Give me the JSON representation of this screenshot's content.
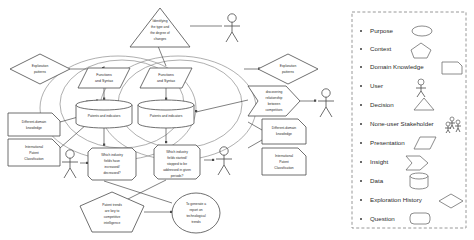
{
  "diagram": {
    "nodes": {
      "decision_top": "Identifying the type and the degree of changes",
      "exploration_left": "Exploration patterns",
      "exploration_right": "Exploration patterns",
      "domain_knowledge_left": "Different-domain knowledge",
      "ipc_left": "International Patent Classification",
      "domain_knowledge_right": "Different-domain knowledge",
      "ipc_right": "International Patent Classification",
      "presentation_left": "Functions and Syntax",
      "presentation_right": "Functions and Syntax",
      "data_left": "Patents and indicators",
      "data_right": "Patents and indicators",
      "question_left": "Which industry fields have increased/ decreased?",
      "question_right": "Which industry fields started/ stopped to be addressed in given periods?",
      "insight_right": "discovering relationship between competitors",
      "context_bottom": "Patent trends are key to competitive intelligence",
      "purpose_bottom": "To generate a report on technological trends"
    },
    "actors": [
      {
        "name": "actor-top-right"
      },
      {
        "name": "actor-right"
      },
      {
        "name": "actor-left-lower"
      },
      {
        "name": "actor-center-lower"
      }
    ]
  },
  "legend": {
    "items": [
      {
        "label": "Purpose",
        "icon": "ellipse-icon"
      },
      {
        "label": "Context",
        "icon": "pentagon-icon"
      },
      {
        "label": "Domain Knowledge",
        "icon": "note-rect-icon"
      },
      {
        "label": "User",
        "icon": "stick-figure-icon"
      },
      {
        "label": "Decision",
        "icon": "triangle-icon"
      },
      {
        "label": "None-user Stakeholder",
        "icon": "group-figures-icon"
      },
      {
        "label": "Presentation",
        "icon": "parallelogram-icon"
      },
      {
        "label": "Insight",
        "icon": "arrow-pentagon-icon"
      },
      {
        "label": "Data",
        "icon": "cylinder-icon"
      },
      {
        "label": "Exploration History",
        "icon": "diamond-icon"
      },
      {
        "label": "Question",
        "icon": "rounded-rect-icon"
      }
    ]
  },
  "colors": {
    "stroke": "#4a4a4a",
    "light_stroke": "#8c8c8c",
    "text": "#2b2b2b",
    "background": "#ffffff"
  }
}
